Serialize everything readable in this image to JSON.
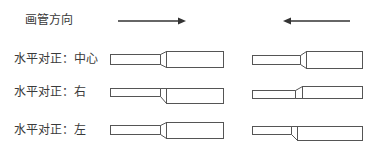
{
  "title": "画管方向",
  "direction_arrows": [
    {
      "side": "left",
      "direction": "right"
    },
    {
      "side": "right",
      "direction": "left"
    }
  ],
  "rows": [
    {
      "label": "水平对正：中心",
      "alignment": "center"
    },
    {
      "label": "水平对正：右",
      "alignment": "right"
    },
    {
      "label": "水平对正：左",
      "alignment": "left"
    }
  ],
  "colors": {
    "stroke": "#555555",
    "text": "#3a3a3a",
    "arrow": "#333333",
    "background": "#ffffff"
  }
}
